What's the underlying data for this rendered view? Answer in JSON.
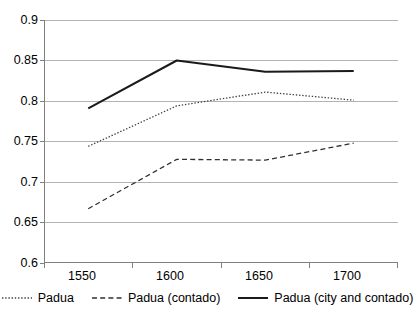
{
  "chart_data": {
    "type": "line",
    "title": "",
    "xlabel": "",
    "ylabel": "",
    "categories": [
      "1550",
      "1600",
      "1650",
      "1700"
    ],
    "ylim": [
      0.6,
      0.9
    ],
    "ytick_labels": [
      "0.9",
      "0.85",
      "0.8",
      "0.75",
      "0.7",
      "0.65",
      "0.6"
    ],
    "ytick_values": [
      0.9,
      0.85,
      0.8,
      0.75,
      0.7,
      0.65,
      0.6
    ],
    "grid": true,
    "legend_position": "bottom",
    "series": [
      {
        "name": "Padua",
        "style": "dotted",
        "color": "#404040",
        "values": [
          0.744,
          0.794,
          0.811,
          0.801
        ]
      },
      {
        "name": "Padua (contado)",
        "style": "dashed",
        "color": "#303030",
        "values": [
          0.667,
          0.728,
          0.727,
          0.748
        ]
      },
      {
        "name": "Padua (city and contado)",
        "style": "solid",
        "color": "#1a1a1a",
        "values": [
          0.791,
          0.85,
          0.836,
          0.837
        ]
      }
    ]
  },
  "axes": {
    "y_labels": [
      "0.9",
      "0.85",
      "0.8",
      "0.75",
      "0.7",
      "0.65",
      "0.6"
    ],
    "x_labels": [
      "1550",
      "1600",
      "1650",
      "1700"
    ]
  },
  "legend": {
    "items": [
      {
        "label": "Padua",
        "swatch": "dotted-line-swatch"
      },
      {
        "label": "Padua (contado)",
        "swatch": "dashed-line-swatch"
      },
      {
        "label": "Padua (city and contado)",
        "swatch": "solid-line-swatch"
      }
    ]
  },
  "colors": {
    "gridline": "#b3b3b3",
    "axis": "#808080",
    "background": "#ffffff",
    "text": "#000000"
  }
}
